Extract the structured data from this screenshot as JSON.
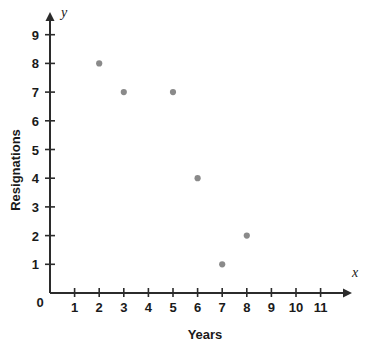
{
  "chart_data": {
    "type": "scatter",
    "title": "",
    "xlabel": "Years",
    "ylabel": "Resignations",
    "x_axis_variable": "x",
    "y_axis_variable": "y",
    "origin_label": "0",
    "xlim": [
      0,
      12
    ],
    "ylim": [
      0,
      9.6
    ],
    "x_ticks": [
      1,
      2,
      3,
      4,
      5,
      6,
      7,
      8,
      9,
      10,
      11
    ],
    "x_tick_labels": [
      "1",
      "2",
      "3",
      "4",
      "5",
      "6",
      "7",
      "8",
      "9",
      "10",
      "11"
    ],
    "y_ticks": [
      1,
      2,
      3,
      4,
      5,
      6,
      7,
      8,
      9
    ],
    "y_tick_labels": [
      "1",
      "2",
      "3",
      "4",
      "5",
      "6",
      "7",
      "8",
      "9"
    ],
    "grid": false,
    "legend": false,
    "point_color": "#8a8a8a",
    "axis_color": "#2b2b2b",
    "background_color": "#ffffff",
    "points": [
      {
        "x": 2,
        "y": 8
      },
      {
        "x": 3,
        "y": 7
      },
      {
        "x": 5,
        "y": 7
      },
      {
        "x": 6,
        "y": 4
      },
      {
        "x": 7,
        "y": 1
      },
      {
        "x": 8,
        "y": 2
      }
    ]
  }
}
